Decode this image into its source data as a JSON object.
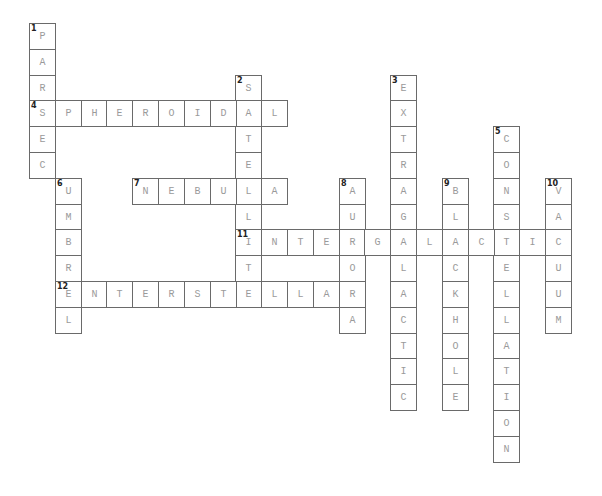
{
  "puzzle": {
    "type": "crossword",
    "grid_origin": {
      "x": 29,
      "y": 23
    },
    "cell_size": 25.8,
    "entries": [
      {
        "number": 1,
        "direction": "down",
        "answer": "PARSEC",
        "row": 0,
        "col": 0
      },
      {
        "number": 2,
        "direction": "down",
        "answer": "SATELLITE",
        "row": 2,
        "col": 8
      },
      {
        "number": 3,
        "direction": "down",
        "answer": "EXTRAGALACTIC",
        "row": 2,
        "col": 14
      },
      {
        "number": 4,
        "direction": "across",
        "answer": "SPHEROIDAL",
        "row": 3,
        "col": 0
      },
      {
        "number": 5,
        "direction": "down",
        "answer": "CONSTELLATION",
        "row": 4,
        "col": 18
      },
      {
        "number": 6,
        "direction": "down",
        "answer": "UMBREL",
        "row": 6,
        "col": 1
      },
      {
        "number": 7,
        "direction": "across",
        "answer": "NEBULA",
        "row": 6,
        "col": 4
      },
      {
        "number": 8,
        "direction": "down",
        "answer": "AURORA",
        "row": 6,
        "col": 12
      },
      {
        "number": 9,
        "direction": "down",
        "answer": "BLACKHOLE",
        "row": 6,
        "col": 16
      },
      {
        "number": 10,
        "direction": "down",
        "answer": "VACUUM",
        "row": 6,
        "col": 20
      },
      {
        "number": 11,
        "direction": "across",
        "answer": "INTERGALACTIC",
        "row": 8,
        "col": 8
      },
      {
        "number": 12,
        "direction": "across",
        "answer": "INTERSTELLAR",
        "row": 10,
        "col": 1
      }
    ]
  }
}
